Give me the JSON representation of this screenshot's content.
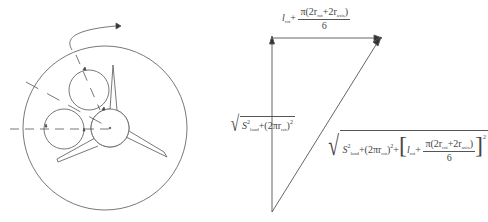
{
  "diagram": {
    "left_figure": {
      "description": "Large circle with three-blade impeller at center; two smaller circles tangent to the hub; dashed radial lines; curved rotation arrow at top",
      "elements": [
        "outer-circle",
        "hub-circle",
        "upper-roller-circle",
        "left-roller-circle",
        "three-blades",
        "dashed-radial-lines",
        "rotation-arrow"
      ]
    },
    "vector_triangle": {
      "top_label": {
        "prefix": "l",
        "prefix_sub": "rot",
        "plus": "+",
        "numerator": "π(2r",
        "num_sub1": "rot",
        "num_mid": "+2r",
        "num_sub2": "axis",
        "num_close": ")",
        "denominator": "6"
      },
      "left_label": {
        "term1": "S",
        "term1_sup": "2",
        "term1_sub": "load",
        "plus": "+(2πr",
        "term2_sub": "rot",
        "close": ")",
        "close_sup": "2"
      },
      "hypotenuse_label": {
        "term1": "S",
        "term1_sup": "2",
        "term1_sub": "load",
        "mid": "+(2πr",
        "mid_sub": "rot",
        "mid_close": ")",
        "mid_sup": "2",
        "plus": "+",
        "bracket_open": "[",
        "l": "l",
        "l_sub": "rot",
        "plus2": "+",
        "numerator": "π(2r",
        "num_sub1": "rot",
        "num_mid": "+2r",
        "num_sub2": "axis",
        "num_close": ")",
        "denominator": "6",
        "bracket_close": "]",
        "outer_sup": "2"
      }
    },
    "colors": {
      "line": "#555555",
      "background": "#ffffff"
    }
  }
}
